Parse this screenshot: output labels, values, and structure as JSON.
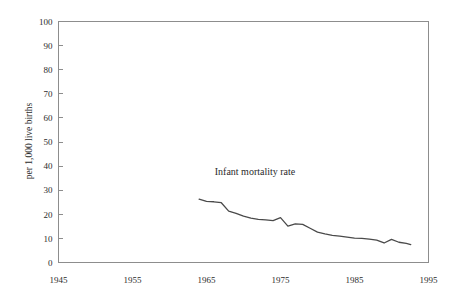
{
  "chart_data": {
    "type": "line",
    "title": "",
    "xlabel": "",
    "ylabel": "per 1,000 live births",
    "annotation": "Infant mortality rate",
    "grid": false,
    "legend_position": "inline-annotation",
    "xlim": [
      1945,
      1995
    ],
    "ylim": [
      0,
      100
    ],
    "xticks": [
      1945,
      1955,
      1965,
      1975,
      1985,
      1995
    ],
    "xticklabels": [
      "1945",
      "1955",
      "1965",
      "1975",
      "1985",
      "1995"
    ],
    "yticks": [
      0,
      10,
      20,
      30,
      40,
      50,
      60,
      70,
      80,
      90,
      100
    ],
    "yticklabels": [
      "0",
      "10",
      "20",
      "30",
      "40",
      "50",
      "60",
      "70",
      "80",
      "90",
      "100"
    ],
    "series": [
      {
        "name": "Infant mortality rate",
        "color": "#4a4a4a",
        "x": [
          1964,
          1965,
          1966,
          1967,
          1968,
          1969,
          1970,
          1971,
          1972,
          1973,
          1974,
          1975,
          1976,
          1977,
          1978,
          1979,
          1980,
          1981,
          1982,
          1983,
          1984,
          1985,
          1986,
          1987,
          1988,
          1989,
          1990,
          1991,
          1992
        ],
        "values": [
          26.3,
          25.4,
          25.2,
          24.8,
          21.3,
          20.4,
          19.2,
          18.4,
          17.9,
          17.7,
          17.4,
          18.6,
          15.1,
          16.0,
          15.8,
          14.2,
          12.6,
          11.9,
          11.3,
          10.9,
          10.5,
          10.1,
          10.0,
          9.7,
          9.3,
          8.1,
          9.6,
          8.4,
          7.9
        ],
        "final_value": 7.4
      }
    ]
  },
  "annotations": {
    "series_label": "Infant mortality rate"
  }
}
